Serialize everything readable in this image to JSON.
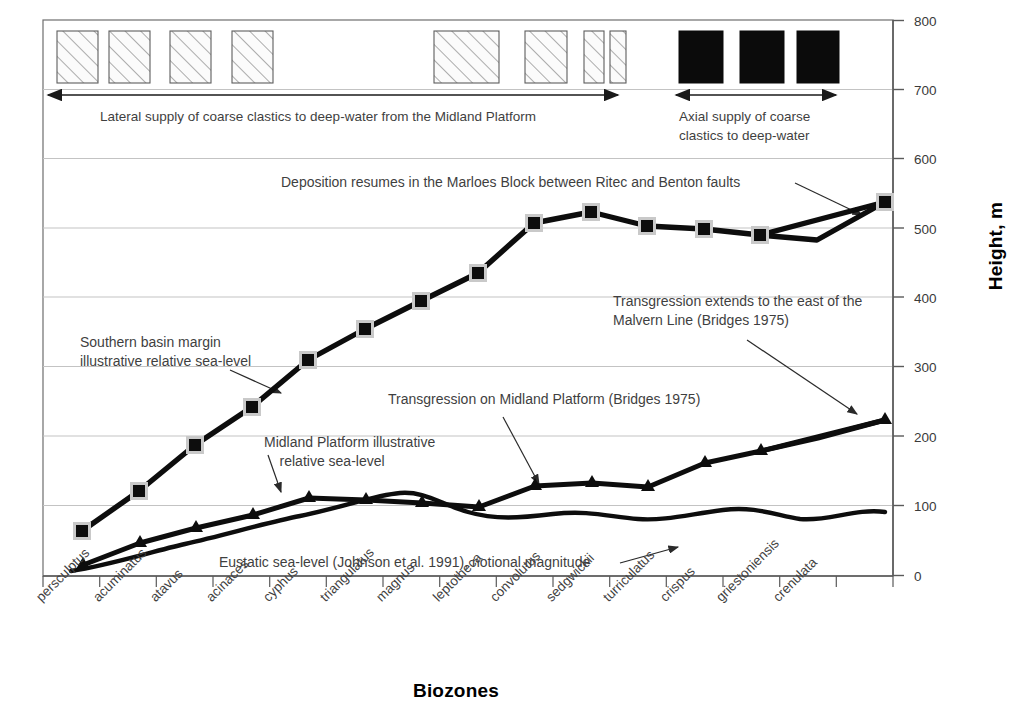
{
  "chart_data": {
    "type": "line",
    "title": "",
    "xlabel": "Biozones",
    "ylabel": "Height, m",
    "ylim": [
      0,
      800
    ],
    "yticks": [
      0,
      100,
      200,
      300,
      400,
      500,
      600,
      700,
      800
    ],
    "grid": true,
    "legend_position": "none (inline annotations)",
    "categories": [
      "persculptus",
      "acuminatus",
      "atavus",
      "acinaces",
      "cyphus",
      "triangulatus",
      "magnus",
      "leptotheca",
      "convolutus",
      "sedgwickii",
      "turriculatus",
      "crispus",
      "griestoniensis",
      "crenulata"
    ],
    "series": [
      {
        "name": "Southern basin margin illustrative relative sea-level",
        "marker": "square",
        "values": [
          65,
          122,
          188,
          243,
          311,
          355,
          396,
          436,
          509,
          525,
          505,
          501,
          492,
          542
        ]
      },
      {
        "name": "Midland Platform illustrative relative sea-level",
        "marker": "triangle",
        "values": [
          16,
          47,
          68,
          87,
          112,
          110,
          106,
          100,
          130,
          134,
          128,
          164,
          180,
          227
        ]
      },
      {
        "name": "Eustatic sea-level (Johnson et al. 1991), notional magnitude",
        "marker": "none",
        "values": [
          6,
          22,
          34,
          45,
          56,
          66,
          73,
          62,
          76,
          68,
          66,
          73,
          66,
          92
        ]
      }
    ],
    "annotations": [
      {
        "text": "Deposition resumes in the Marloes Block between Ritec and Benton faults"
      },
      {
        "text": "Transgression extends to the east of the\nMalvern Line (Bridges 1975)"
      },
      {
        "text": "Transgression on Midland Platform (Bridges 1975)"
      },
      {
        "text": "Southern basin margin\nillustrative relative sea-level"
      },
      {
        "text": "Midland Platform illustrative\n    relative sea-level"
      },
      {
        "text": "Eustatic sea-level (Johnson et al. 1991), notional magnitude"
      }
    ],
    "supply_bands": [
      {
        "label": "Lateral supply of coarse clastics to deep-water from the Midland Platform"
      },
      {
        "label": "Axial supply of coarse\nclastics to deep-water"
      }
    ],
    "colors": {
      "line": "#000000",
      "grid": "#bfbfbf",
      "axis": "#595959",
      "text": "#3f3f3f",
      "hatch_fill": "#fbfbfb",
      "solid_fill": "#0b0b0b"
    }
  }
}
